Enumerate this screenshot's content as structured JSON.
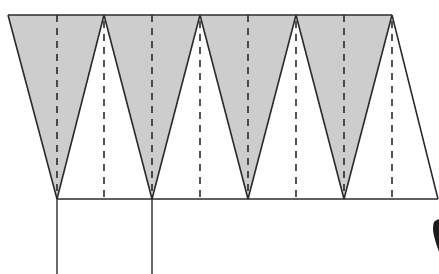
{
  "diagram": {
    "title": "",
    "width": 439,
    "height": 274,
    "colors": {
      "background": "#ffffff",
      "stroke": "#2a2a2a",
      "shaded_fill": "#cdcdcd",
      "dashed": "#2a2a2a",
      "blob": "#1a1a1a"
    },
    "top_line": {
      "y": 15,
      "x_start": 8,
      "x_end": 392
    },
    "bottom_line": {
      "y": 199,
      "x_start": 57,
      "x_end": 438
    },
    "apex_points_top": [
      8,
      104,
      200,
      296,
      392
    ],
    "vertex_points_bottom": [
      57,
      152,
      248,
      344
    ],
    "shaded_triangles": [
      {
        "top_left": 8,
        "top_right": 104,
        "bottom": 57
      },
      {
        "top_left": 104,
        "top_right": 200,
        "bottom": 152
      },
      {
        "top_left": 200,
        "top_right": 296,
        "bottom": 248
      },
      {
        "top_left": 296,
        "top_right": 392,
        "bottom": 344
      }
    ],
    "right_edge": {
      "from": [
        392,
        15
      ],
      "to": [
        438,
        199
      ]
    },
    "dashed_lines_full": [
      57,
      152,
      248,
      344
    ],
    "dashed_lines_from_apex": [
      104,
      200,
      296,
      392
    ],
    "vertical_lines_below": [
      {
        "x": 57,
        "y_start": 199,
        "y_end": 274
      },
      {
        "x": 152,
        "y_start": 199,
        "y_end": 274
      }
    ],
    "dash_pattern": "7,6"
  }
}
